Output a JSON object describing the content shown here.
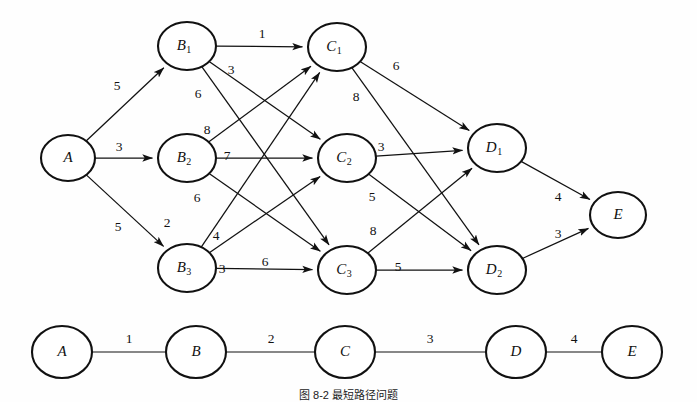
{
  "figure": {
    "caption": "图 8-2  最短路径问题",
    "background_color": "#fefefe",
    "stroke_color": "#111111"
  },
  "graph_data": {
    "type": "diagram",
    "title": "Layered shortest-path network",
    "layers": [
      {
        "name": "source",
        "nodes": [
          "A"
        ]
      },
      {
        "name": "stage-B",
        "nodes": [
          "B1",
          "B2",
          "B3"
        ]
      },
      {
        "name": "stage-C",
        "nodes": [
          "C1",
          "C2",
          "C3"
        ]
      },
      {
        "name": "stage-D",
        "nodes": [
          "D1",
          "D2"
        ]
      },
      {
        "name": "sink",
        "nodes": [
          "E"
        ]
      }
    ],
    "nodes": [
      {
        "id": "A",
        "base": "A",
        "sub": "",
        "cx": 68,
        "cy": 158,
        "rx": 27,
        "ry": 23
      },
      {
        "id": "B1",
        "base": "B",
        "sub": "1",
        "cx": 187,
        "cy": 46,
        "rx": 29,
        "ry": 24
      },
      {
        "id": "B2",
        "base": "B",
        "sub": "2",
        "cx": 187,
        "cy": 158,
        "rx": 29,
        "ry": 24
      },
      {
        "id": "B3",
        "base": "B",
        "sub": "3",
        "cx": 187,
        "cy": 268,
        "rx": 29,
        "ry": 24
      },
      {
        "id": "C1",
        "base": "C",
        "sub": "1",
        "cx": 337,
        "cy": 47,
        "rx": 29,
        "ry": 24
      },
      {
        "id": "C2",
        "base": "C",
        "sub": "2",
        "cx": 347,
        "cy": 158,
        "rx": 29,
        "ry": 24
      },
      {
        "id": "C3",
        "base": "C",
        "sub": "3",
        "cx": 347,
        "cy": 270,
        "rx": 29,
        "ry": 24
      },
      {
        "id": "D1",
        "base": "D",
        "sub": "1",
        "cx": 497,
        "cy": 148,
        "rx": 29,
        "ry": 24
      },
      {
        "id": "D2",
        "base": "D",
        "sub": "2",
        "cx": 497,
        "cy": 270,
        "rx": 29,
        "ry": 24
      },
      {
        "id": "E",
        "base": "E",
        "sub": "",
        "cx": 618,
        "cy": 215,
        "rx": 28,
        "ry": 23
      }
    ],
    "edges": [
      {
        "from": "A",
        "to": "B1",
        "weight": "5",
        "lx": 117,
        "ly": 87
      },
      {
        "from": "A",
        "to": "B2",
        "weight": "3",
        "lx": 119,
        "ly": 148
      },
      {
        "from": "A",
        "to": "B3",
        "weight": "5",
        "lx": 118,
        "ly": 228
      },
      {
        "from": "B1",
        "to": "C1",
        "weight": "1",
        "lx": 262,
        "ly": 35
      },
      {
        "from": "B1",
        "to": "C2",
        "weight": "3",
        "lx": 231,
        "ly": 71
      },
      {
        "from": "B1",
        "to": "C3",
        "weight": "6",
        "lx": 198,
        "ly": 95
      },
      {
        "from": "B2",
        "to": "C1",
        "weight": "8",
        "lx": 207,
        "ly": 131
      },
      {
        "from": "B2",
        "to": "C2",
        "weight": "7",
        "lx": 227,
        "ly": 157
      },
      {
        "from": "B2",
        "to": "C3",
        "weight": "6",
        "lx": 197,
        "ly": 199
      },
      {
        "from": "B3",
        "to": "C1",
        "weight": "2",
        "lx": 167,
        "ly": 224
      },
      {
        "from": "B3",
        "to": "C2",
        "weight": "4",
        "lx": 216,
        "ly": 237
      },
      {
        "from": "B3",
        "to": "C3",
        "weight": "3",
        "lx": 222,
        "ly": 270
      },
      {
        "from": "B3",
        "to": "C3",
        "weight": "6",
        "lx": 265,
        "ly": 263,
        "duplicate_label": true
      },
      {
        "from": "C1",
        "to": "D1",
        "weight": "6",
        "lx": 396,
        "ly": 67
      },
      {
        "from": "C1",
        "to": "D2",
        "weight": "8",
        "lx": 356,
        "ly": 98
      },
      {
        "from": "C2",
        "to": "D1",
        "weight": "3",
        "lx": 381,
        "ly": 148
      },
      {
        "from": "C2",
        "to": "D2",
        "weight": "5",
        "lx": 372,
        "ly": 198
      },
      {
        "from": "C3",
        "to": "D1",
        "weight": "8",
        "lx": 373,
        "ly": 232
      },
      {
        "from": "C3",
        "to": "D2",
        "weight": "5",
        "lx": 398,
        "ly": 268
      },
      {
        "from": "D1",
        "to": "E",
        "weight": "4",
        "lx": 558,
        "ly": 198
      },
      {
        "from": "D2",
        "to": "E",
        "weight": "3",
        "lx": 558,
        "ly": 235
      }
    ]
  },
  "chain_data": {
    "type": "diagram",
    "title": "Condensed stage chain",
    "nodes": [
      {
        "id": "A",
        "base": "A",
        "cx": 62,
        "cy": 352,
        "rx": 30,
        "ry": 26
      },
      {
        "id": "B",
        "base": "B",
        "cx": 196,
        "cy": 352,
        "rx": 30,
        "ry": 26
      },
      {
        "id": "C",
        "base": "C",
        "cx": 345,
        "cy": 352,
        "rx": 30,
        "ry": 26
      },
      {
        "id": "D",
        "base": "D",
        "cx": 516,
        "cy": 352,
        "rx": 30,
        "ry": 26
      },
      {
        "id": "E",
        "base": "E",
        "cx": 632,
        "cy": 352,
        "rx": 30,
        "ry": 26
      }
    ],
    "edges": [
      {
        "from": "A",
        "to": "B",
        "weight": "1",
        "lx": 129,
        "ly": 340
      },
      {
        "from": "B",
        "to": "C",
        "weight": "2",
        "lx": 271,
        "ly": 340
      },
      {
        "from": "C",
        "to": "D",
        "weight": "3",
        "lx": 430,
        "ly": 340
      },
      {
        "from": "D",
        "to": "E",
        "weight": "4",
        "lx": 574,
        "ly": 340
      }
    ]
  }
}
